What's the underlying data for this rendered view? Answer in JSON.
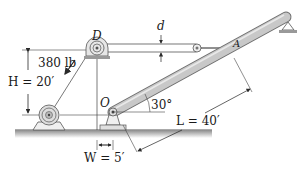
{
  "labels": {
    "pulley": "D",
    "pin": "O",
    "attachment": "A",
    "rod_diameter": "d",
    "force": "380 lb",
    "height": "H = 20′",
    "angle": "30°",
    "length": "L = 40′",
    "width": "W = 5′"
  },
  "colors": {
    "boom_fill": "#c8c8c8",
    "boom_stroke": "#6e6e6e",
    "line": "#3a3a3a",
    "ground": "#9a9a9a"
  }
}
